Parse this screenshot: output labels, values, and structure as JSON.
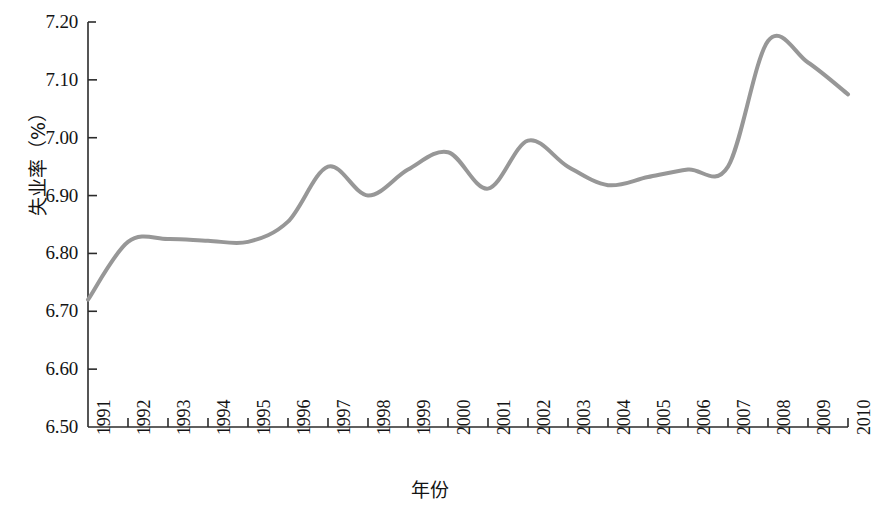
{
  "chart_data": {
    "type": "line",
    "title": "",
    "xlabel": "年份",
    "ylabel": "失业率（%）",
    "x": [
      1991,
      1992,
      1993,
      1994,
      1995,
      1996,
      1997,
      1998,
      1999,
      2000,
      2001,
      2002,
      2003,
      2004,
      2005,
      2006,
      2007,
      2008,
      2009,
      2010
    ],
    "categories": [
      "1991",
      "1992",
      "1993",
      "1994",
      "1995",
      "1996",
      "1997",
      "1998",
      "1999",
      "2000",
      "2001",
      "2002",
      "2003",
      "2004",
      "2005",
      "2006",
      "2007",
      "2008",
      "2009",
      "2010"
    ],
    "values": [
      6.72,
      6.82,
      6.825,
      6.822,
      6.82,
      6.855,
      6.95,
      6.9,
      6.945,
      6.975,
      6.912,
      6.995,
      6.95,
      6.918,
      6.932,
      6.945,
      6.95,
      7.167,
      7.13,
      7.075
    ],
    "series": [
      {
        "name": "失业率",
        "values": [
          6.72,
          6.82,
          6.825,
          6.822,
          6.82,
          6.855,
          6.95,
          6.9,
          6.945,
          6.975,
          6.912,
          6.995,
          6.95,
          6.918,
          6.932,
          6.945,
          6.95,
          7.167,
          7.13,
          7.075
        ]
      }
    ],
    "ylim": [
      6.5,
      7.2
    ],
    "xlim": [
      1991,
      2010
    ],
    "yticks": [
      6.5,
      6.6,
      6.7,
      6.8,
      6.9,
      7.0,
      7.1,
      7.2
    ],
    "ytick_labels": [
      "6.50",
      "6.60",
      "6.70",
      "6.80",
      "6.90",
      "7.00",
      "7.10",
      "7.20"
    ],
    "xticks": [
      1991,
      1992,
      1993,
      1994,
      1995,
      1996,
      1997,
      1998,
      1999,
      2000,
      2001,
      2002,
      2003,
      2004,
      2005,
      2006,
      2007,
      2008,
      2009,
      2010
    ],
    "grid": false,
    "legend": false,
    "line_color": "#979797",
    "line_width": 4,
    "smoothing": "spline",
    "axis_color": "#2b2b2b",
    "background_color": "#ffffff"
  }
}
